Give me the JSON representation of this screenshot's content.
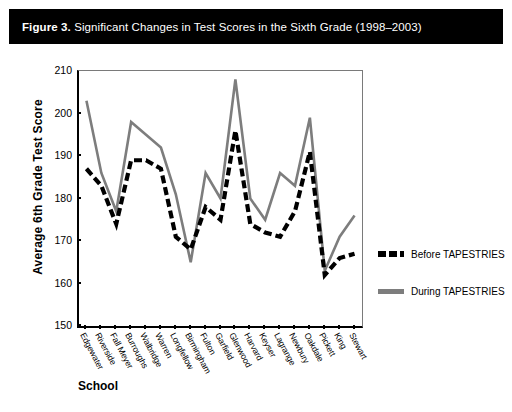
{
  "figure": {
    "number_label": "Figure 3.",
    "caption": "Significant Changes in Test Scores in the Sixth Grade (1998–2003)"
  },
  "colors": {
    "before_series": "#000000",
    "during_series": "#7d7d7d",
    "title_bar_bg": "#000000",
    "title_bar_text": "#ffffff",
    "axis": "#000000"
  },
  "axis": {
    "ylabel": "Average 6th Grade Test Score",
    "xlabel": "School",
    "yticks": [
      210,
      200,
      190,
      180,
      170,
      160,
      150
    ]
  },
  "legend": {
    "position": "right",
    "entries": [
      {
        "label": "Before TAPESTRIES",
        "style": "dashed",
        "color": "#000000"
      },
      {
        "label": "During TAPESTRIES",
        "style": "solid",
        "color": "#7d7d7d"
      }
    ]
  },
  "chart_data": {
    "type": "line",
    "title": "Significant Changes in Test Scores in the Sixth Grade (1998–2003)",
    "xlabel": "School",
    "ylabel": "Average 6th Grade Test Score",
    "ylim": [
      150,
      210
    ],
    "ytick_step": 10,
    "grid": false,
    "legend_position": "right",
    "categories": [
      "Edgewater",
      "Riverside",
      "Fall Meyer",
      "Burroughs",
      "Walbridge",
      "Warren",
      "Longfellow",
      "Birmingham",
      "Fulton",
      "Garfield",
      "Glenwood",
      "Harvard",
      "Keyser",
      "Lagrange",
      "Newbury",
      "Oakdale",
      "Pickett",
      "King",
      "Stewart"
    ],
    "series": [
      {
        "name": "Before TAPESTRIES",
        "style": "dashed",
        "color": "#000000",
        "values": [
          187,
          183,
          174,
          189,
          189,
          187,
          171,
          168,
          178,
          175,
          196,
          174,
          172,
          171,
          177,
          191,
          162,
          166,
          167
        ]
      },
      {
        "name": "During TAPESTRIES",
        "style": "solid",
        "color": "#7d7d7d",
        "values": [
          203,
          186,
          177,
          198,
          195,
          192,
          181,
          165,
          186,
          180,
          208,
          180,
          175,
          186,
          183,
          199,
          163,
          171,
          176
        ]
      }
    ]
  }
}
